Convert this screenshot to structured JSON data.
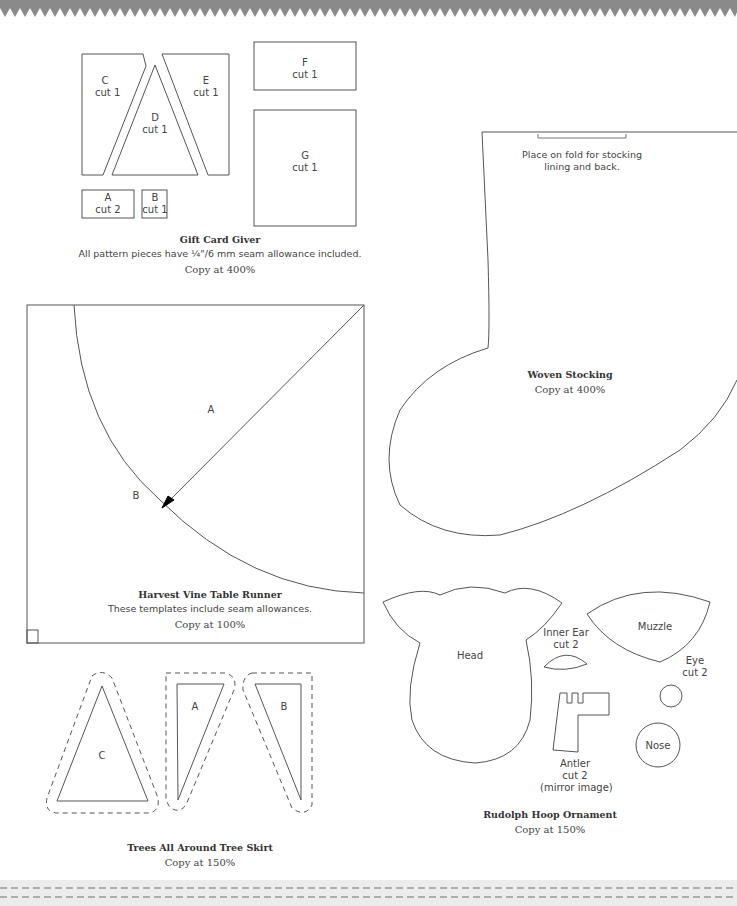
{
  "colors": {
    "line": "#555555",
    "border": "#8a8a8a",
    "text": "#444444"
  },
  "gift_card_giver": {
    "title": "Gift Card Giver",
    "note": "All pattern pieces have ¼\"/6 mm seam allowance included.",
    "copy": "Copy at 400%",
    "pieces": [
      {
        "letter": "A",
        "cut": "cut 2"
      },
      {
        "letter": "B",
        "cut": "cut 1"
      },
      {
        "letter": "C",
        "cut": "cut 1"
      },
      {
        "letter": "D",
        "cut": "cut 1"
      },
      {
        "letter": "E",
        "cut": "cut 1"
      },
      {
        "letter": "F",
        "cut": "cut 1"
      },
      {
        "letter": "G",
        "cut": "cut 1"
      }
    ]
  },
  "woven_stocking": {
    "title": "Woven Stocking",
    "fold_note_line1": "Place on fold for stocking",
    "fold_note_line2": "lining and back.",
    "copy": "Copy at 400%"
  },
  "table_runner": {
    "title": "Harvest Vine Table Runner",
    "note": "These templates include seam allowances.",
    "copy": "Copy at 100%",
    "labels": [
      "A",
      "B"
    ]
  },
  "rudolph": {
    "title": "Rudolph Hoop Ornament",
    "copy": "Copy at 150%",
    "head": "Head",
    "inner_ear": "Inner Ear",
    "inner_ear_cut": "cut 2",
    "muzzle": "Muzzle",
    "eye": "Eye",
    "eye_cut": "cut 2",
    "nose": "Nose",
    "antler": "Antler",
    "antler_cut": "cut 2",
    "antler_note": "(mirror image)"
  },
  "tree_skirt": {
    "title": "Trees All Around Tree Skirt",
    "copy": "Copy at 150%",
    "labels": [
      "C",
      "A",
      "B"
    ]
  }
}
